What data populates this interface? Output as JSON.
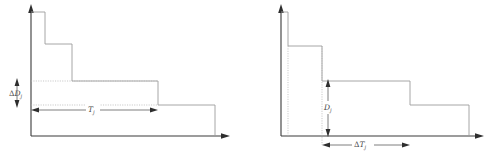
{
  "figure": {
    "title": "",
    "type": "step-function-diagram-pair",
    "panels": [
      {
        "id": "left",
        "name": "delta-D-panel",
        "axes": {
          "y_axis_label": "",
          "x_axis_label": "",
          "y_arrow": "up",
          "x_arrow": "right"
        },
        "annotations": [
          {
            "name": "delta-D-label",
            "delta": "Δ",
            "symbol": "D",
            "subscript": "j",
            "orientation": "vertical",
            "text": "ΔD"
          },
          {
            "name": "T-label",
            "delta": "",
            "symbol": "T",
            "subscript": "j",
            "orientation": "horizontal",
            "text": "T"
          }
        ]
      },
      {
        "id": "right",
        "name": "delta-T-panel",
        "axes": {
          "y_axis_label": "",
          "x_axis_label": "",
          "y_arrow": "up",
          "x_arrow": "right"
        },
        "annotations": [
          {
            "name": "D-label",
            "delta": "",
            "symbol": "D",
            "subscript": "j",
            "orientation": "vertical",
            "text": "D"
          },
          {
            "name": "delta-T-label",
            "delta": "Δ",
            "symbol": "T",
            "subscript": "j",
            "orientation": "horizontal",
            "text": "ΔT"
          }
        ]
      }
    ]
  },
  "chart_data": {
    "type": "bar",
    "title": "",
    "xlabel": "",
    "ylabel": "",
    "panels": [
      {
        "name": "left-step-function",
        "description": "decreasing staircase with dimension markers for ΔD_j (vertical) and T_j (horizontal)",
        "steps": [
          {
            "x_start": 31,
            "x_end": 45,
            "height": 128
          },
          {
            "x_start": 45,
            "x_end": 72,
            "height": 96
          },
          {
            "x_start": 72,
            "x_end": 158,
            "height": 59
          },
          {
            "x_start": 158,
            "x_end": 215,
            "height": 35
          }
        ],
        "baseline_y": 136,
        "guides": [
          {
            "type": "horizontal",
            "y": 81,
            "from_x": 31,
            "to_x": 158
          },
          {
            "type": "horizontal",
            "y": 105,
            "from_x": 31,
            "to_x": 158
          }
        ],
        "dimensions": [
          {
            "label": "ΔD",
            "sub": "j",
            "orientation": "vertical",
            "from": 81,
            "to": 105,
            "at": 17
          },
          {
            "label": "T",
            "sub": "j",
            "orientation": "horizontal",
            "from": 31,
            "to": 158,
            "at": 110
          }
        ]
      },
      {
        "name": "right-step-function",
        "description": "decreasing staircase with dimension markers for D_j (vertical) and ΔT_j (horizontal)",
        "steps": [
          {
            "x_start": 281,
            "x_end": 288,
            "height": 124
          },
          {
            "x_start": 288,
            "x_end": 322,
            "height": 90
          },
          {
            "x_start": 322,
            "x_end": 410,
            "height": 55
          },
          {
            "x_start": 410,
            "x_end": 469,
            "height": 31
          }
        ],
        "baseline_y": 136,
        "guides": [
          {
            "type": "vertical",
            "x": 288,
            "from_y": 46,
            "to_y": 136
          },
          {
            "type": "vertical",
            "x": 322,
            "from_y": 46,
            "to_y": 145
          }
        ],
        "dimensions": [
          {
            "label": "D",
            "sub": "j",
            "orientation": "vertical",
            "from": 81,
            "to": 136,
            "at": 328
          },
          {
            "label": "ΔT",
            "sub": "j",
            "orientation": "horizontal",
            "from": 322,
            "to": 410,
            "at": 145
          }
        ]
      }
    ],
    "grid": false,
    "legend": "none"
  },
  "colors": {
    "axis": "#3a3a3a",
    "step": "#9c9c9c",
    "guide": "#b0b0b0",
    "dimension": "#5d5d5d",
    "label": "#4a4a4a",
    "background": "#ffffff"
  }
}
